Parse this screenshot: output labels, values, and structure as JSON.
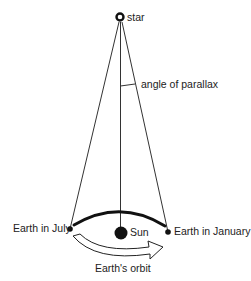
{
  "diagram": {
    "labels": {
      "star": "star",
      "angle": "angle of parallax",
      "july": "Earth in July",
      "sun": "Sun",
      "january": "Earth in January",
      "orbit": "Earth's orbit"
    },
    "colors": {
      "ink": "#1a1a1a",
      "background": "#ffffff"
    }
  }
}
